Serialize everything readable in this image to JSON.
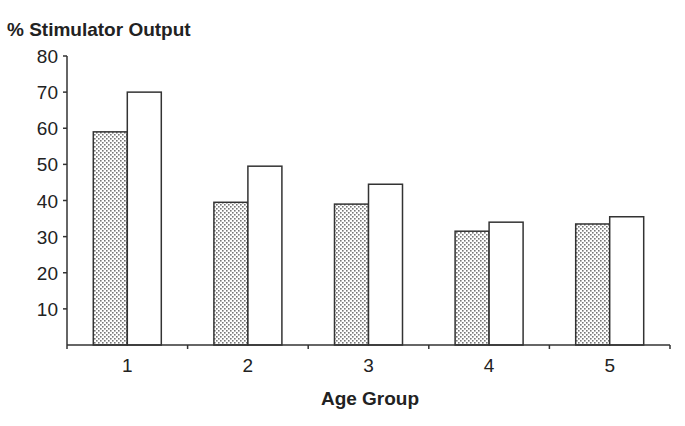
{
  "chart_data": {
    "type": "bar",
    "title": "% Stimulator Output",
    "xlabel": "Age Group",
    "ylabel": "% Stimulator Output",
    "categories": [
      "1",
      "2",
      "3",
      "4",
      "5"
    ],
    "series": [
      {
        "name": "Series A (dotted)",
        "fill": "dotted",
        "values": [
          59,
          39.5,
          39,
          31.5,
          33.5
        ]
      },
      {
        "name": "Series B (white)",
        "fill": "white",
        "values": [
          70,
          49.5,
          44.5,
          34,
          35.5
        ]
      }
    ],
    "ylim": [
      0,
      80
    ],
    "yticks": [
      10,
      20,
      30,
      40,
      50,
      60,
      70,
      80
    ],
    "grid": false,
    "legend": "none",
    "colors": {
      "line": "#333333",
      "dot": "#777777",
      "background": "#ffffff"
    }
  }
}
